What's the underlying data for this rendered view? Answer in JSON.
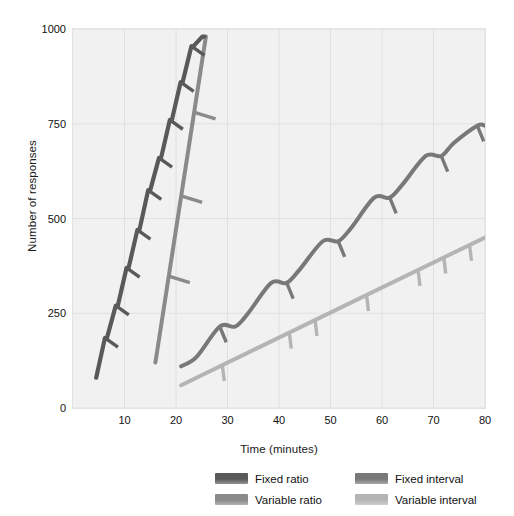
{
  "chart_data": {
    "type": "line",
    "title": "",
    "subtitle": "",
    "xlabel": "Time (minutes)",
    "ylabel": "Number of responses",
    "xlim": [
      0,
      80
    ],
    "ylim": [
      0,
      1000
    ],
    "xticks": [
      10,
      20,
      30,
      40,
      50,
      60,
      70,
      80
    ],
    "yticks": [
      0,
      250,
      500,
      750,
      1000
    ],
    "xtick_labels": [
      "10",
      "20",
      "30",
      "40",
      "50",
      "60",
      "70",
      "80"
    ],
    "ytick_labels": [
      "0",
      "250",
      "500",
      "750",
      "1000"
    ],
    "grid": true,
    "grid_color": "#e0e0e0",
    "plot_background": "#f1f1f1",
    "legend_position": "bottom",
    "annotation": "Tick marks on each curve indicate delivery of a reinforcer.",
    "series": [
      {
        "name": "Fixed ratio",
        "color": "#595959",
        "style": "stepped cumulative record with post-reinforcement pauses",
        "x": [
          4.5,
          6.2,
          6.6,
          8.3,
          8.7,
          10.4,
          10.8,
          12.5,
          12.9,
          14.6,
          15.0,
          16.7,
          17.1,
          18.8,
          19.2,
          20.9,
          21.3,
          23.0,
          23.4,
          25.1,
          25.5
        ],
        "y": [
          80,
          185,
          185,
          270,
          270,
          370,
          370,
          470,
          470,
          575,
          575,
          660,
          660,
          760,
          760,
          860,
          860,
          955,
          955,
          980,
          980
        ],
        "reinforcer_marks_x": [
          6.2,
          8.3,
          10.4,
          12.5,
          14.6,
          16.7,
          18.8,
          20.9,
          23.0
        ],
        "reinforcer_marks_y": [
          185,
          270,
          370,
          470,
          575,
          660,
          760,
          860,
          955
        ]
      },
      {
        "name": "Variable ratio",
        "color": "#8a8a8a",
        "style": "steep straight cumulative line with irregular reinforcer marks",
        "x": [
          16.0,
          25.8
        ],
        "y": [
          120,
          980
        ],
        "reinforcer_marks_x": [
          18.6,
          21.0,
          23.6
        ],
        "reinforcer_marks_y": [
          348,
          560,
          780
        ]
      },
      {
        "name": "Fixed interval",
        "color": "#787878",
        "style": "scalloped cumulative record with post-reinforcement pauses",
        "x": [
          21.0,
          24.0,
          28.5,
          31.5,
          34.0,
          38.5,
          41.5,
          44.0,
          48.5,
          51.5,
          54.0,
          58.5,
          61.5,
          64.0,
          68.5,
          71.5,
          74.0,
          78.5,
          80.0
        ],
        "y": [
          110,
          135,
          215,
          215,
          250,
          330,
          330,
          365,
          440,
          440,
          475,
          555,
          555,
          590,
          665,
          665,
          700,
          745,
          745
        ],
        "reinforcer_marks_x": [
          28.5,
          41.5,
          51.5,
          61.5,
          71.5,
          78.5
        ],
        "reinforcer_marks_y": [
          215,
          330,
          440,
          555,
          665,
          745
        ]
      },
      {
        "name": "Variable interval",
        "color": "#b4b4b4",
        "style": "shallow straight cumulative line with irregular reinforcer marks",
        "x": [
          21.0,
          80.0
        ],
        "y": [
          60,
          450
        ],
        "reinforcer_marks_x": [
          29.0,
          42.0,
          47.0,
          57.0,
          67.0,
          72.0,
          77.0
        ],
        "reinforcer_marks_y": [
          113,
          199,
          232,
          298,
          364,
          397,
          430
        ]
      }
    ]
  },
  "legend": {
    "items": [
      {
        "label": "Fixed ratio",
        "color": "#595959"
      },
      {
        "label": "Fixed interval",
        "color": "#787878"
      },
      {
        "label": "Variable ratio",
        "color": "#8a8a8a"
      },
      {
        "label": "Variable interval",
        "color": "#b4b4b4"
      }
    ]
  }
}
